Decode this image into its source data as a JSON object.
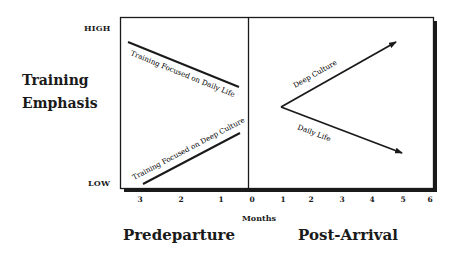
{
  "diagram": {
    "y_axis": {
      "title_line1": "Training",
      "title_line2": "Emphasis",
      "high_label": "HIGH",
      "low_label": "LOW"
    },
    "x_axis": {
      "label": "Months",
      "predeparture_ticks": [
        "3",
        "2",
        "1",
        "0"
      ],
      "post_arrival_ticks": [
        "1",
        "2",
        "3",
        "4",
        "5",
        "6"
      ]
    },
    "phases": {
      "left": "Predeparture",
      "right": "Post-Arrival"
    },
    "lines": {
      "pre_daily_life": "Training Focused on Daily Life",
      "pre_deep_culture": "Training Focused on Deep Culture",
      "post_deep_culture": "Deep Culture",
      "post_daily_life": "Daily Life"
    },
    "colors": {
      "ink": "#1a1a1a",
      "background": "#ffffff"
    }
  }
}
